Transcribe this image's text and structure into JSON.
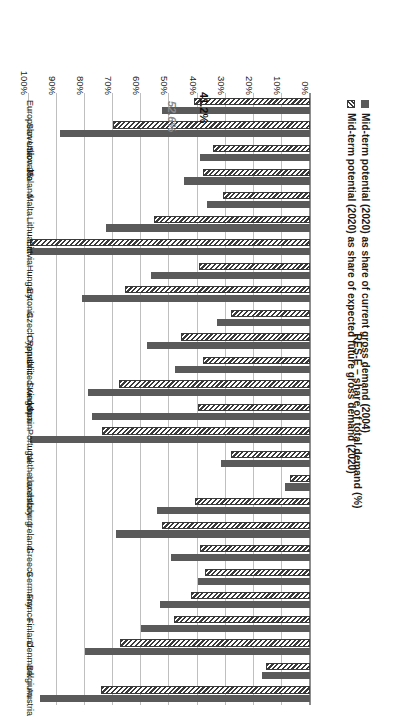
{
  "chart_data": {
    "type": "bar",
    "orientation": "horizontal",
    "title": "",
    "xlabel": "RES-E – share of total demand (%)",
    "ylabel": "",
    "xlim": [
      0,
      100
    ],
    "xticks": [
      "0%",
      "10%",
      "20%",
      "30%",
      "40%",
      "50%",
      "60%",
      "70%",
      "80%",
      "90%",
      "100%"
    ],
    "grid": true,
    "legend_position": "bottom-left",
    "categories": [
      "Austria",
      "Belgium",
      "Denmark",
      "Finland",
      "France",
      "Germany",
      "Greece",
      "Ireland",
      "Italy",
      "Luxembourg",
      "Netherlands",
      "Portugal",
      "Spain",
      "Sweden",
      "United Kingdom",
      "Cyprus",
      "Czech Republic",
      "Estonia",
      "Hungary",
      "Latvia",
      "Lithuania",
      "Malta",
      "Poland",
      "Slovakia",
      "Slovenia",
      "European Union 25"
    ],
    "series": [
      {
        "name": "Mid-term potential (2020) as share of current gross demand (2004)",
        "key": "current",
        "color": "#5a5a5a",
        "pattern": "solid",
        "values": [
          96.0,
          17.0,
          80.0,
          60.0,
          53.5,
          40.0,
          49.5,
          69.0,
          54.5,
          9.0,
          31.5,
          99.5,
          77.5,
          79.0,
          48.0,
          58.0,
          33.0,
          81.0,
          56.5,
          99.5,
          72.5,
          36.5,
          45.0,
          39.0,
          89.0,
          52.6
        ]
      },
      {
        "name": "Mid-term potential (2020) as share of expected future gross demand (2020)",
        "key": "future",
        "color": "#3a3a3a",
        "pattern": "hatched",
        "values": [
          74.5,
          15.5,
          67.5,
          48.5,
          42.5,
          37.5,
          39.0,
          52.5,
          41.0,
          7.0,
          28.0,
          74.0,
          40.0,
          68.0,
          38.0,
          46.0,
          28.0,
          66.0,
          39.5,
          99.5,
          55.5,
          31.0,
          38.0,
          34.5,
          70.0,
          41.2
        ]
      }
    ],
    "annotations": [
      {
        "key": "current",
        "category": "European Union 25",
        "text": "52.6%"
      },
      {
        "key": "future",
        "category": "European Union 25",
        "text": "41.2%"
      }
    ]
  },
  "legend": {
    "items": [
      {
        "label": "Mid-term potential (2020) as share of current gross demand (2004)",
        "swatch": "solid-square-swatch"
      },
      {
        "label": "Mid-term potential (2020) as share of expected future gross demand (2020)",
        "swatch": "hatched-square-swatch"
      }
    ]
  },
  "axis": {
    "title": "RES-E – share of total demand (%)"
  }
}
